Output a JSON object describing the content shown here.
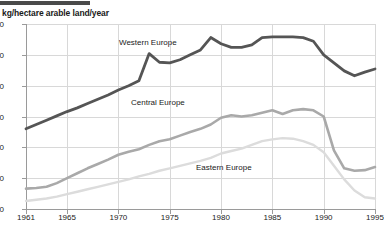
{
  "chart_title": "kg/hectare arable land/year",
  "axes": {
    "y_ticks": [
      0,
      50,
      100,
      150,
      200,
      250,
      300
    ],
    "x_ticks": [
      1961,
      1965,
      1970,
      1975,
      1980,
      1985,
      1990,
      1995
    ],
    "ylim": [
      0,
      300
    ],
    "xlim": [
      1961,
      1995
    ]
  },
  "labels": {
    "western": "Western Europe",
    "central": "Central Europe",
    "eastern": "Eastern Europe"
  },
  "colors": {
    "western": "#555555",
    "central": "#a9a9a9",
    "eastern": "#dcdcdc",
    "grid": "#d8d8d8",
    "axis": "#9a9a9a",
    "text": "#1a1a1a",
    "top_bar": "#4a4a4a"
  },
  "chart_data": {
    "type": "line",
    "title": "kg/hectare arable land/year",
    "xlabel": "",
    "ylabel": "kg/hectare arable land/year",
    "xlim": [
      1961,
      1995
    ],
    "ylim": [
      0,
      300
    ],
    "grid": true,
    "legend": "inline-annotations",
    "x": [
      1961,
      1962,
      1963,
      1964,
      1965,
      1966,
      1967,
      1968,
      1969,
      1970,
      1971,
      1972,
      1973,
      1974,
      1975,
      1976,
      1977,
      1978,
      1979,
      1980,
      1981,
      1982,
      1983,
      1984,
      1985,
      1986,
      1987,
      1988,
      1989,
      1990,
      1991,
      1992,
      1993,
      1994,
      1995
    ],
    "series": [
      {
        "name": "Western Europe",
        "color": "#555555",
        "values": [
          130,
          137,
          144,
          151,
          158,
          164,
          171,
          178,
          185,
          193,
          200,
          208,
          252,
          238,
          237,
          242,
          250,
          258,
          278,
          268,
          262,
          262,
          266,
          278,
          279,
          279,
          279,
          278,
          272,
          250,
          237,
          224,
          216,
          222,
          227
        ]
      },
      {
        "name": "Central Europe",
        "color": "#a9a9a9",
        "values": [
          33,
          34,
          36,
          42,
          50,
          58,
          66,
          73,
          80,
          88,
          93,
          97,
          104,
          110,
          113,
          119,
          125,
          130,
          137,
          148,
          152,
          150,
          152,
          156,
          160,
          154,
          160,
          162,
          160,
          150,
          95,
          66,
          62,
          63,
          68
        ]
      },
      {
        "name": "Eastern Europe",
        "color": "#dcdcdc",
        "values": [
          13,
          15,
          17,
          20,
          24,
          28,
          32,
          36,
          40,
          44,
          48,
          53,
          57,
          62,
          66,
          70,
          74,
          78,
          83,
          90,
          94,
          98,
          104,
          110,
          113,
          115,
          114,
          110,
          104,
          92,
          70,
          48,
          30,
          19,
          17
        ]
      }
    ],
    "annotations": [
      {
        "text": "Western Europe",
        "x": 1971,
        "y": 262
      },
      {
        "text": "Central Europe",
        "x": 1972,
        "y": 168
      },
      {
        "text": "Eastern Europe",
        "x": 1979,
        "y": 72
      }
    ]
  }
}
